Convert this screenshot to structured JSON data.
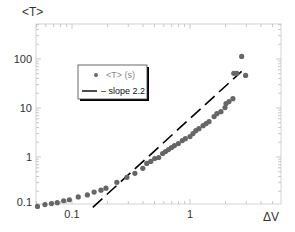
{
  "chart_data": {
    "type": "scatter",
    "title": "",
    "xlabel": "ΔV",
    "ylabel": "<T>",
    "xscale": "log",
    "yscale": "log",
    "xlim": [
      0.05,
      5.9
    ],
    "ylim": [
      0.1,
      515
    ],
    "grid": false,
    "legend_position": "upper-left-inside",
    "x_ticks": [
      {
        "value": 0.1,
        "label": "0.1"
      },
      {
        "value": 1,
        "label": "1"
      }
    ],
    "y_ticks": [
      {
        "value": 0.1,
        "label": "0.1"
      },
      {
        "value": 1,
        "label": "1"
      },
      {
        "value": 10,
        "label": "10"
      },
      {
        "value": 100,
        "label": "100"
      }
    ],
    "series": [
      {
        "name": "<T> (s)",
        "type": "scatter",
        "color": "#666666",
        "x": [
          0.051,
          0.059,
          0.067,
          0.075,
          0.085,
          0.095,
          0.113,
          0.135,
          0.154,
          0.176,
          0.194,
          0.24,
          0.292,
          0.341,
          0.398,
          0.43,
          0.465,
          0.502,
          0.543,
          0.586,
          0.62,
          0.657,
          0.697,
          0.738,
          0.797,
          0.861,
          0.913,
          1.0,
          1.06,
          1.12,
          1.19,
          1.29,
          1.37,
          1.45,
          1.6,
          1.69,
          1.83,
          1.98,
          2.02,
          2.14,
          2.31,
          2.35,
          2.49,
          2.74,
          2.96
        ],
        "y": [
          0.098,
          0.107,
          0.112,
          0.117,
          0.128,
          0.134,
          0.153,
          0.168,
          0.192,
          0.21,
          0.231,
          0.304,
          0.385,
          0.464,
          0.587,
          0.74,
          0.812,
          0.932,
          0.977,
          1.18,
          1.29,
          1.42,
          1.56,
          1.71,
          1.88,
          2.16,
          2.37,
          2.61,
          3.0,
          3.45,
          3.79,
          4.36,
          4.8,
          5.28,
          6.67,
          7.66,
          8.43,
          10.2,
          12.3,
          13.5,
          15.5,
          50.9,
          50.9,
          113,
          46.2
        ]
      },
      {
        "name": "– slope 2.2",
        "type": "line",
        "style": "dashed",
        "color": "#000000",
        "slope": 2.2,
        "x": [
          0.15,
          2.74
        ],
        "y": [
          0.094,
          56.0
        ]
      }
    ]
  },
  "legend": {
    "items": [
      {
        "label": "<T> (s)",
        "marker": "dot"
      },
      {
        "label": "– slope 2.2",
        "marker": "line"
      }
    ]
  },
  "axes": {
    "x_title": "ΔV",
    "y_title": "<T>",
    "x_tick_labels": [
      "0.1",
      "1"
    ],
    "y_tick_labels": [
      "0.1",
      "1",
      "10",
      "100"
    ]
  }
}
